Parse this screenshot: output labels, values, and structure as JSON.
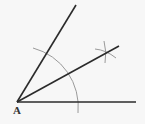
{
  "diagram": {
    "vertex_label": "A",
    "colors": {
      "background": "#f7f7f7",
      "ray": "#2b2b2b",
      "construction_arc": "#9a9a9a"
    },
    "elements": [
      {
        "type": "ray",
        "name": "base-ray",
        "from": [
          17,
          102
        ],
        "to": [
          136,
          102
        ]
      },
      {
        "type": "ray",
        "name": "upper-ray",
        "from": [
          17,
          102
        ],
        "to": [
          76,
          5
        ]
      },
      {
        "type": "ray",
        "name": "bisector-ray",
        "from": [
          17,
          102
        ],
        "to": [
          119,
          46
        ]
      },
      {
        "type": "arc",
        "name": "construction-arc",
        "center": [
          17,
          102
        ],
        "radius": 61
      },
      {
        "type": "arc-marks",
        "name": "intersection-arcs",
        "at": [
          106,
          53
        ]
      }
    ]
  }
}
